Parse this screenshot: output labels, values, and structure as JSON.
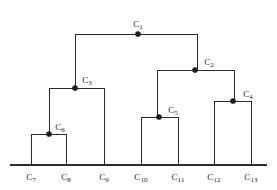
{
  "figure": {
    "type": "dendrogram",
    "title": "",
    "background_color": "#ffffff",
    "line_color": "#2b2b2b",
    "node_color": "#1d1d1d",
    "text_color": "#1d1d1d"
  },
  "chart_data": {
    "type": "tree",
    "title": "",
    "xlabel": "",
    "ylabel": "",
    "grid": false,
    "legend": null,
    "axis": {
      "x_start": 10,
      "x_end": 267,
      "y": 165
    },
    "leaves": [
      {
        "id": "C7",
        "label_prefix": "C",
        "label_sub": "7",
        "x": 31,
        "parent": "C6"
      },
      {
        "id": "C8",
        "label_prefix": "C",
        "label_sub": "8",
        "x": 66,
        "parent": "C6"
      },
      {
        "id": "C9",
        "label_prefix": "C",
        "label_sub": "9",
        "x": 104,
        "parent": "C3"
      },
      {
        "id": "C10",
        "label_prefix": "C",
        "label_sub": "10",
        "x": 141,
        "parent": "C5"
      },
      {
        "id": "C11",
        "label_prefix": "C",
        "label_sub": "11",
        "x": 178,
        "parent": "C5"
      },
      {
        "id": "C12",
        "label_prefix": "C",
        "label_sub": "12",
        "x": 214,
        "parent": "C4"
      },
      {
        "id": "C13",
        "label_prefix": "C",
        "label_sub": "13",
        "x": 251,
        "parent": "C4"
      }
    ],
    "internal_nodes": [
      {
        "id": "C1",
        "label_prefix": "C",
        "label_sub": "1",
        "x": 138,
        "y": 34,
        "left_x": 75,
        "right_x": 197,
        "children": [
          "C3",
          "C2"
        ],
        "label_dx": 0,
        "label_dy": -7
      },
      {
        "id": "C2",
        "label_prefix": "C",
        "label_sub": "2",
        "x": 195,
        "y": 70,
        "left_x": 157,
        "right_x": 234,
        "children": [
          "C5",
          "C4"
        ],
        "label_dx": 14,
        "label_dy": -5
      },
      {
        "id": "C3",
        "label_prefix": "C",
        "label_sub": "3",
        "x": 75,
        "y": 88,
        "left_x": 49,
        "right_x": 104,
        "children": [
          "C6",
          "C9"
        ],
        "label_dx": 12,
        "label_dy": -5
      },
      {
        "id": "C4",
        "label_prefix": "C",
        "label_sub": "4",
        "x": 233,
        "y": 101,
        "left_x": 214,
        "right_x": 251,
        "children": [
          "C12",
          "C13"
        ],
        "label_dx": 15,
        "label_dy": -4
      },
      {
        "id": "C5",
        "label_prefix": "C",
        "label_sub": "5",
        "x": 159,
        "y": 117,
        "left_x": 141,
        "right_x": 178,
        "children": [
          "C10",
          "C11"
        ],
        "label_dx": 14,
        "label_dy": -4
      },
      {
        "id": "C6",
        "label_prefix": "C",
        "label_sub": "6",
        "x": 49,
        "y": 134,
        "left_x": 31,
        "right_x": 66,
        "children": [
          "C7",
          "C8"
        ],
        "label_dx": 11,
        "label_dy": -4
      }
    ],
    "links": [
      {
        "from": "C1",
        "to": "C3",
        "drop_x": 75,
        "from_y": 34,
        "to_y": 88
      },
      {
        "from": "C1",
        "to": "C2",
        "drop_x": 197,
        "from_y": 34,
        "to_y": 70
      },
      {
        "from": "C2",
        "to": "C5",
        "drop_x": 157,
        "from_y": 70,
        "to_y": 117
      },
      {
        "from": "C2",
        "to": "C4",
        "drop_x": 234,
        "from_y": 70,
        "to_y": 101
      },
      {
        "from": "C3",
        "to": "C6",
        "drop_x": 49,
        "from_y": 88,
        "to_y": 134
      },
      {
        "from": "C3",
        "to": "C9",
        "drop_x": 104,
        "from_y": 88,
        "to_y": 165
      },
      {
        "from": "C4",
        "to": "C12",
        "drop_x": 214,
        "from_y": 101,
        "to_y": 165
      },
      {
        "from": "C4",
        "to": "C13",
        "drop_x": 251,
        "from_y": 101,
        "to_y": 165
      },
      {
        "from": "C5",
        "to": "C10",
        "drop_x": 141,
        "from_y": 117,
        "to_y": 165
      },
      {
        "from": "C5",
        "to": "C11",
        "drop_x": 178,
        "from_y": 117,
        "to_y": 165
      },
      {
        "from": "C6",
        "to": "C7",
        "drop_x": 31,
        "from_y": 134,
        "to_y": 165
      },
      {
        "from": "C6",
        "to": "C8",
        "drop_x": 66,
        "from_y": 134,
        "to_y": 165
      }
    ],
    "leaf_label_y": 180,
    "node_radius": 2.6
  }
}
